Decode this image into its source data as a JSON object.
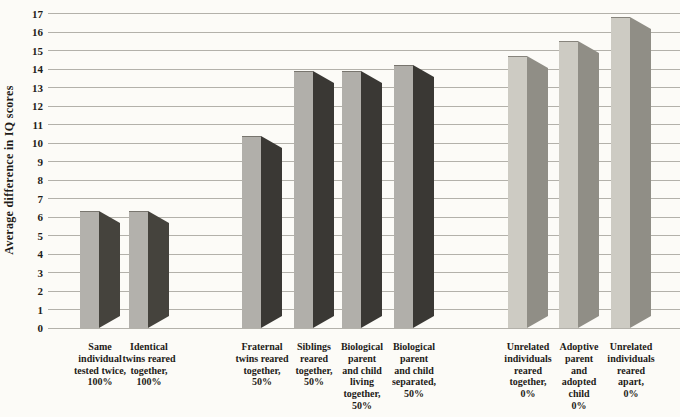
{
  "chart_data": {
    "type": "bar",
    "title": "",
    "xlabel": "",
    "ylabel": "Average difference in IQ scores",
    "ylim": [
      0,
      17
    ],
    "ytick_step": 1,
    "grid": "horizontal",
    "legend": "none",
    "style_note": "3D-effect bars, scanned textbook figure",
    "background_color": "#fcfbf7",
    "gridline_color": "#b3b1aa",
    "text_color": "#1e1c18",
    "group_colors": {
      "100%": {
        "front": "#b3b1ac",
        "side": "#45433d"
      },
      "50%": {
        "front": "#b1afaa",
        "side": "#3a3834"
      },
      "0%": {
        "front": "#cdcbc3",
        "side": "#908e86"
      }
    },
    "bars": [
      {
        "label": "Same individual tested twice, 100%",
        "label_lines": [
          "Same",
          "individual",
          "tested twice,",
          "100%"
        ],
        "value": 6.3,
        "group": "100%"
      },
      {
        "label": "Identical twins reared together, 100%",
        "label_lines": [
          "Identical",
          "twins reared",
          "together,",
          "100%"
        ],
        "value": 6.3,
        "group": "100%"
      },
      {
        "label": "Fraternal twins reared together, 50%",
        "label_lines": [
          "Fraternal",
          "twins reared",
          "together,",
          "50%"
        ],
        "value": 10.4,
        "group": "50%"
      },
      {
        "label": "Siblings reared together, 50%",
        "label_lines": [
          "Siblings",
          "reared",
          "together,",
          "50%"
        ],
        "value": 13.9,
        "group": "50%"
      },
      {
        "label": "Biological parent and child living together, 50%",
        "label_lines": [
          "Biological",
          "parent",
          "and child",
          "living",
          "together,",
          "50%"
        ],
        "value": 13.9,
        "group": "50%"
      },
      {
        "label": "Biological parent and child separated, 50%",
        "label_lines": [
          "Biological",
          "parent",
          "and child",
          "separated,",
          "50%"
        ],
        "value": 14.2,
        "group": "50%"
      },
      {
        "label": "Unrelated individuals reared together, 0%",
        "label_lines": [
          "Unrelated",
          "individuals",
          "reared",
          "together,",
          "0%"
        ],
        "value": 14.7,
        "group": "0%"
      },
      {
        "label": "Adoptive parent and adopted child 0%",
        "label_lines": [
          "Adoptive",
          "parent",
          "and",
          "adopted",
          "child",
          "0%"
        ],
        "value": 15.5,
        "group": "0%"
      },
      {
        "label": "Unrelated individuals reared apart, 0%",
        "label_lines": [
          "Unrelated",
          "individuals",
          "reared",
          "apart,",
          "0%"
        ],
        "value": 16.8,
        "group": "0%"
      }
    ]
  }
}
